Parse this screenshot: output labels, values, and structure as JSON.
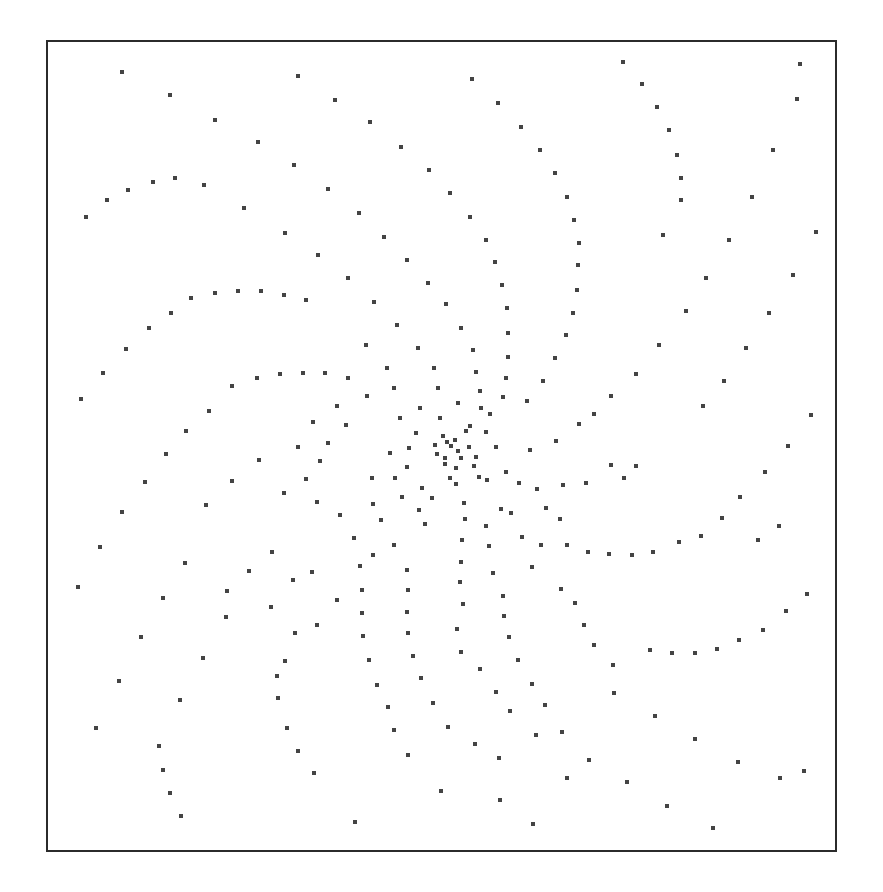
{
  "figure": {
    "frame": {
      "x": 46,
      "y": 40,
      "width": 787,
      "height": 808,
      "border_color": "#2b2b2b"
    },
    "dot_color": "#444444",
    "dot_size": 4,
    "points": [
      [
        122,
        72
      ],
      [
        298,
        76
      ],
      [
        472,
        79
      ],
      [
        623,
        62
      ],
      [
        800,
        64
      ],
      [
        170,
        95
      ],
      [
        335,
        100
      ],
      [
        498,
        103
      ],
      [
        642,
        84
      ],
      [
        797,
        99
      ],
      [
        215,
        120
      ],
      [
        370,
        122
      ],
      [
        521,
        127
      ],
      [
        657,
        107
      ],
      [
        258,
        142
      ],
      [
        401,
        147
      ],
      [
        540,
        150
      ],
      [
        669,
        130
      ],
      [
        773,
        150
      ],
      [
        294,
        165
      ],
      [
        429,
        170
      ],
      [
        555,
        173
      ],
      [
        677,
        155
      ],
      [
        128,
        190
      ],
      [
        153,
        182
      ],
      [
        175,
        178
      ],
      [
        204,
        185
      ],
      [
        328,
        189
      ],
      [
        450,
        193
      ],
      [
        567,
        197
      ],
      [
        681,
        178
      ],
      [
        752,
        197
      ],
      [
        107,
        200
      ],
      [
        86,
        217
      ],
      [
        244,
        208
      ],
      [
        359,
        213
      ],
      [
        470,
        217
      ],
      [
        574,
        220
      ],
      [
        681,
        200
      ],
      [
        816,
        232
      ],
      [
        285,
        233
      ],
      [
        384,
        237
      ],
      [
        486,
        240
      ],
      [
        579,
        243
      ],
      [
        729,
        240
      ],
      [
        663,
        235
      ],
      [
        318,
        255
      ],
      [
        407,
        260
      ],
      [
        495,
        262
      ],
      [
        578,
        265
      ],
      [
        348,
        278
      ],
      [
        428,
        283
      ],
      [
        502,
        285
      ],
      [
        577,
        290
      ],
      [
        706,
        278
      ],
      [
        793,
        275
      ],
      [
        191,
        298
      ],
      [
        215,
        293
      ],
      [
        238,
        291
      ],
      [
        261,
        291
      ],
      [
        284,
        295
      ],
      [
        306,
        300
      ],
      [
        374,
        302
      ],
      [
        446,
        304
      ],
      [
        507,
        308
      ],
      [
        573,
        313
      ],
      [
        686,
        311
      ],
      [
        769,
        313
      ],
      [
        149,
        328
      ],
      [
        171,
        313
      ],
      [
        397,
        325
      ],
      [
        461,
        328
      ],
      [
        508,
        333
      ],
      [
        566,
        335
      ],
      [
        659,
        345
      ],
      [
        746,
        348
      ],
      [
        126,
        349
      ],
      [
        366,
        345
      ],
      [
        418,
        348
      ],
      [
        473,
        350
      ],
      [
        508,
        357
      ],
      [
        555,
        358
      ],
      [
        636,
        374
      ],
      [
        724,
        381
      ],
      [
        103,
        373
      ],
      [
        257,
        378
      ],
      [
        280,
        374
      ],
      [
        303,
        373
      ],
      [
        325,
        373
      ],
      [
        348,
        378
      ],
      [
        387,
        368
      ],
      [
        434,
        368
      ],
      [
        476,
        372
      ],
      [
        506,
        378
      ],
      [
        543,
        381
      ],
      [
        611,
        396
      ],
      [
        703,
        406
      ],
      [
        81,
        399
      ],
      [
        232,
        386
      ],
      [
        394,
        388
      ],
      [
        438,
        388
      ],
      [
        480,
        391
      ],
      [
        503,
        397
      ],
      [
        527,
        401
      ],
      [
        594,
        414
      ],
      [
        811,
        415
      ],
      [
        209,
        411
      ],
      [
        367,
        396
      ],
      [
        420,
        408
      ],
      [
        458,
        403
      ],
      [
        481,
        408
      ],
      [
        490,
        414
      ],
      [
        579,
        424
      ],
      [
        788,
        446
      ],
      [
        186,
        431
      ],
      [
        337,
        406
      ],
      [
        400,
        418
      ],
      [
        440,
        418
      ],
      [
        470,
        426
      ],
      [
        556,
        441
      ],
      [
        636,
        466
      ],
      [
        166,
        454
      ],
      [
        313,
        422
      ],
      [
        346,
        425
      ],
      [
        416,
        433
      ],
      [
        443,
        436
      ],
      [
        455,
        440
      ],
      [
        466,
        431
      ],
      [
        486,
        432
      ],
      [
        530,
        450
      ],
      [
        765,
        472
      ],
      [
        145,
        482
      ],
      [
        298,
        447
      ],
      [
        328,
        443
      ],
      [
        409,
        448
      ],
      [
        435,
        445
      ],
      [
        447,
        442
      ],
      [
        451,
        446
      ],
      [
        458,
        451
      ],
      [
        469,
        447
      ],
      [
        496,
        447
      ],
      [
        611,
        465
      ],
      [
        740,
        497
      ],
      [
        320,
        461
      ],
      [
        390,
        453
      ],
      [
        437,
        454
      ],
      [
        445,
        458
      ],
      [
        461,
        458
      ],
      [
        476,
        457
      ],
      [
        506,
        472
      ],
      [
        586,
        483
      ],
      [
        722,
        518
      ],
      [
        122,
        512
      ],
      [
        259,
        460
      ],
      [
        306,
        479
      ],
      [
        407,
        467
      ],
      [
        445,
        464
      ],
      [
        456,
        468
      ],
      [
        474,
        466
      ],
      [
        487,
        480
      ],
      [
        563,
        485
      ],
      [
        701,
        536
      ],
      [
        232,
        481
      ],
      [
        284,
        493
      ],
      [
        395,
        478
      ],
      [
        422,
        488
      ],
      [
        450,
        478
      ],
      [
        479,
        477
      ],
      [
        519,
        483
      ],
      [
        537,
        489
      ],
      [
        624,
        478
      ],
      [
        679,
        542
      ],
      [
        100,
        547
      ],
      [
        206,
        505
      ],
      [
        317,
        502
      ],
      [
        372,
        478
      ],
      [
        402,
        497
      ],
      [
        432,
        498
      ],
      [
        456,
        484
      ],
      [
        501,
        509
      ],
      [
        546,
        508
      ],
      [
        653,
        552
      ],
      [
        632,
        555
      ],
      [
        609,
        554
      ],
      [
        588,
        552
      ],
      [
        567,
        545
      ],
      [
        272,
        552
      ],
      [
        340,
        515
      ],
      [
        373,
        504
      ],
      [
        419,
        510
      ],
      [
        464,
        503
      ],
      [
        511,
        513
      ],
      [
        560,
        519
      ],
      [
        779,
        526
      ],
      [
        185,
        563
      ],
      [
        249,
        571
      ],
      [
        312,
        572
      ],
      [
        381,
        520
      ],
      [
        425,
        524
      ],
      [
        465,
        519
      ],
      [
        486,
        526
      ],
      [
        522,
        537
      ],
      [
        758,
        540
      ],
      [
        78,
        587
      ],
      [
        227,
        591
      ],
      [
        293,
        580
      ],
      [
        354,
        538
      ],
      [
        394,
        545
      ],
      [
        462,
        540
      ],
      [
        489,
        546
      ],
      [
        541,
        545
      ],
      [
        807,
        594
      ],
      [
        163,
        598
      ],
      [
        271,
        607
      ],
      [
        373,
        555
      ],
      [
        407,
        570
      ],
      [
        461,
        562
      ],
      [
        493,
        573
      ],
      [
        532,
        567
      ],
      [
        786,
        611
      ],
      [
        141,
        637
      ],
      [
        226,
        617
      ],
      [
        337,
        600
      ],
      [
        360,
        566
      ],
      [
        408,
        590
      ],
      [
        460,
        582
      ],
      [
        503,
        596
      ],
      [
        561,
        589
      ],
      [
        763,
        630
      ],
      [
        203,
        658
      ],
      [
        317,
        625
      ],
      [
        362,
        590
      ],
      [
        407,
        612
      ],
      [
        463,
        604
      ],
      [
        504,
        616
      ],
      [
        575,
        603
      ],
      [
        739,
        640
      ],
      [
        650,
        650
      ],
      [
        672,
        653
      ],
      [
        695,
        653
      ],
      [
        717,
        649
      ],
      [
        119,
        681
      ],
      [
        295,
        633
      ],
      [
        362,
        613
      ],
      [
        408,
        633
      ],
      [
        457,
        629
      ],
      [
        509,
        637
      ],
      [
        584,
        625
      ],
      [
        180,
        700
      ],
      [
        285,
        661
      ],
      [
        363,
        636
      ],
      [
        413,
        656
      ],
      [
        461,
        652
      ],
      [
        518,
        660
      ],
      [
        594,
        645
      ],
      [
        96,
        728
      ],
      [
        277,
        676
      ],
      [
        369,
        660
      ],
      [
        421,
        678
      ],
      [
        480,
        669
      ],
      [
        532,
        684
      ],
      [
        613,
        665
      ],
      [
        159,
        746
      ],
      [
        278,
        698
      ],
      [
        377,
        685
      ],
      [
        433,
        703
      ],
      [
        496,
        692
      ],
      [
        545,
        705
      ],
      [
        614,
        693
      ],
      [
        163,
        770
      ],
      [
        287,
        728
      ],
      [
        388,
        707
      ],
      [
        448,
        727
      ],
      [
        510,
        711
      ],
      [
        562,
        732
      ],
      [
        655,
        716
      ],
      [
        170,
        793
      ],
      [
        298,
        751
      ],
      [
        394,
        730
      ],
      [
        475,
        744
      ],
      [
        536,
        735
      ],
      [
        589,
        760
      ],
      [
        695,
        739
      ],
      [
        181,
        816
      ],
      [
        314,
        773
      ],
      [
        408,
        755
      ],
      [
        499,
        758
      ],
      [
        567,
        778
      ],
      [
        627,
        782
      ],
      [
        738,
        762
      ],
      [
        355,
        822
      ],
      [
        441,
        791
      ],
      [
        500,
        800
      ],
      [
        533,
        824
      ],
      [
        667,
        806
      ],
      [
        713,
        828
      ],
      [
        780,
        778
      ],
      [
        804,
        771
      ]
    ]
  }
}
